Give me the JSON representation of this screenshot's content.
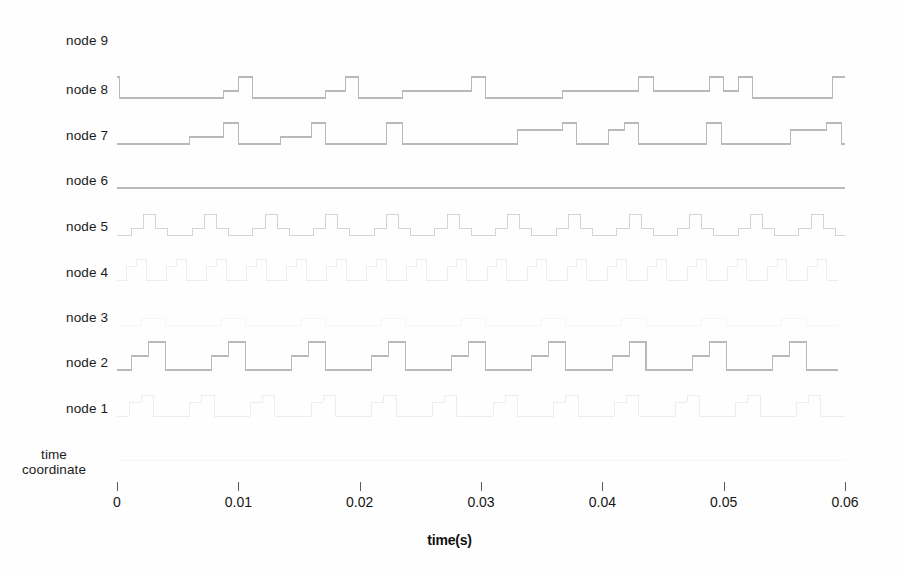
{
  "figure": {
    "background": "#fefefe",
    "trace_color_strong": "#b9b9bd",
    "trace_color_faint": "#ececf0",
    "axis_color": "#5a5a5a"
  },
  "axes": {
    "x_title": "time(s)",
    "x_ticks": [
      "0",
      "0.01",
      "0.02",
      "0.03",
      "0.04",
      "0.05",
      "0.06"
    ],
    "x_tick_values": [
      0,
      0.01,
      0.02,
      0.03,
      0.04,
      0.05,
      0.06
    ],
    "x_min": 0,
    "x_max": 0.06,
    "y_labels": [
      "node 9",
      "node 8",
      "node 7",
      "node 6",
      "node 5",
      "node 4",
      "node 3",
      "node 2",
      "node 1",
      "time\ncoordinate"
    ]
  },
  "chart_data": {
    "type": "line",
    "title": "",
    "xlabel": "time(s)",
    "ylabel": "",
    "xlim": [
      0,
      0.06
    ],
    "grid": false,
    "legend": null,
    "row_labels": [
      "node 9",
      "node 8",
      "node 7",
      "node 6",
      "node 5",
      "node 4",
      "node 3",
      "node 2",
      "node 1",
      "time coordinate"
    ],
    "series": [
      {
        "name": "node 9 / node 8 trace",
        "baseline_label": "node 8",
        "visibility": "strong",
        "points": [
          [
            0.0,
            3
          ],
          [
            0.0002,
            3
          ],
          [
            0.0002,
            0
          ],
          [
            0.0088,
            0
          ],
          [
            0.0088,
            1
          ],
          [
            0.01,
            1
          ],
          [
            0.01,
            3
          ],
          [
            0.0112,
            3
          ],
          [
            0.0112,
            0
          ],
          [
            0.0172,
            0
          ],
          [
            0.0172,
            1
          ],
          [
            0.0188,
            1
          ],
          [
            0.0188,
            3
          ],
          [
            0.0199,
            3
          ],
          [
            0.0199,
            0
          ],
          [
            0.0235,
            0
          ],
          [
            0.0235,
            1
          ],
          [
            0.0292,
            1
          ],
          [
            0.0292,
            3
          ],
          [
            0.0304,
            3
          ],
          [
            0.0304,
            0
          ],
          [
            0.0367,
            0
          ],
          [
            0.0367,
            1
          ],
          [
            0.043,
            1
          ],
          [
            0.043,
            3
          ],
          [
            0.0442,
            3
          ],
          [
            0.0442,
            1
          ],
          [
            0.0488,
            1
          ],
          [
            0.0488,
            3
          ],
          [
            0.05,
            3
          ],
          [
            0.05,
            1
          ],
          [
            0.0512,
            1
          ],
          [
            0.0512,
            3
          ],
          [
            0.0524,
            3
          ],
          [
            0.0524,
            0
          ],
          [
            0.059,
            0
          ],
          [
            0.059,
            3
          ],
          [
            0.06,
            3
          ]
        ]
      },
      {
        "name": "node 7 trace",
        "baseline_label": "node 7",
        "visibility": "strong",
        "points": [
          [
            0.0,
            0
          ],
          [
            0.006,
            0
          ],
          [
            0.006,
            1
          ],
          [
            0.0088,
            1
          ],
          [
            0.0088,
            3
          ],
          [
            0.01,
            3
          ],
          [
            0.01,
            0
          ],
          [
            0.0135,
            0
          ],
          [
            0.0135,
            1
          ],
          [
            0.016,
            1
          ],
          [
            0.016,
            3
          ],
          [
            0.0172,
            3
          ],
          [
            0.0172,
            0
          ],
          [
            0.0222,
            0
          ],
          [
            0.0222,
            3
          ],
          [
            0.0235,
            3
          ],
          [
            0.0235,
            0
          ],
          [
            0.033,
            0
          ],
          [
            0.033,
            2
          ],
          [
            0.0367,
            2
          ],
          [
            0.0367,
            3
          ],
          [
            0.0379,
            3
          ],
          [
            0.0379,
            0
          ],
          [
            0.0405,
            0
          ],
          [
            0.0405,
            2
          ],
          [
            0.0418,
            2
          ],
          [
            0.0418,
            3
          ],
          [
            0.043,
            3
          ],
          [
            0.043,
            0
          ],
          [
            0.0486,
            0
          ],
          [
            0.0486,
            3
          ],
          [
            0.0498,
            3
          ],
          [
            0.0498,
            0
          ],
          [
            0.0555,
            0
          ],
          [
            0.0555,
            2
          ],
          [
            0.0585,
            2
          ],
          [
            0.0585,
            3
          ],
          [
            0.0597,
            3
          ],
          [
            0.0597,
            0
          ],
          [
            0.06,
            0
          ]
        ]
      },
      {
        "name": "node 6 trace",
        "baseline_label": "node 6",
        "visibility": "strong",
        "constant": true,
        "points": [
          [
            0.0,
            0
          ],
          [
            0.06,
            0
          ]
        ]
      },
      {
        "name": "node 5 trace",
        "baseline_label": "node 5",
        "visibility": "medium",
        "periodic": true,
        "period": 0.005,
        "cycle_points": [
          [
            0.0,
            0
          ],
          [
            0.0012,
            0
          ],
          [
            0.0012,
            1
          ],
          [
            0.0022,
            1
          ],
          [
            0.0022,
            3
          ],
          [
            0.0032,
            3
          ],
          [
            0.0032,
            1
          ],
          [
            0.0042,
            1
          ],
          [
            0.0042,
            0
          ],
          [
            0.005,
            0
          ]
        ],
        "cycles": 12
      },
      {
        "name": "node 4 trace",
        "baseline_label": "node 4",
        "visibility": "faint",
        "periodic": true,
        "period": 0.0033,
        "cycle_points": [
          [
            0.0,
            0
          ],
          [
            0.0008,
            0
          ],
          [
            0.0008,
            2
          ],
          [
            0.0016,
            2
          ],
          [
            0.0016,
            3
          ],
          [
            0.0024,
            3
          ],
          [
            0.0024,
            0
          ],
          [
            0.0033,
            0
          ]
        ],
        "cycles": 18
      },
      {
        "name": "node 3 trace",
        "baseline_label": "node 3",
        "visibility": "very-faint",
        "periodic": true,
        "period": 0.0066,
        "cycle_points": [
          [
            0.0,
            0
          ],
          [
            0.002,
            0
          ],
          [
            0.002,
            1
          ],
          [
            0.004,
            1
          ],
          [
            0.004,
            0
          ],
          [
            0.0066,
            0
          ]
        ],
        "cycles": 9
      },
      {
        "name": "node 2 trace",
        "baseline_label": "node 2",
        "visibility": "strong",
        "periodic": true,
        "period": 0.0066,
        "cycle_points": [
          [
            0.0,
            0
          ],
          [
            0.0012,
            0
          ],
          [
            0.0012,
            2
          ],
          [
            0.0026,
            2
          ],
          [
            0.0026,
            4
          ],
          [
            0.004,
            4
          ],
          [
            0.004,
            0
          ],
          [
            0.0066,
            0
          ]
        ],
        "cycles": 9
      },
      {
        "name": "node 1 trace",
        "baseline_label": "node 1",
        "visibility": "faint",
        "periodic": true,
        "period": 0.005,
        "cycle_points": [
          [
            0.0,
            0
          ],
          [
            0.001,
            0
          ],
          [
            0.001,
            2
          ],
          [
            0.002,
            2
          ],
          [
            0.002,
            3
          ],
          [
            0.003,
            3
          ],
          [
            0.003,
            0
          ],
          [
            0.005,
            0
          ]
        ],
        "cycles": 12
      },
      {
        "name": "time coordinate trace",
        "baseline_label": "time coordinate",
        "visibility": "very-faint",
        "constant": true,
        "points": [
          [
            0.0,
            0
          ],
          [
            0.06,
            0
          ]
        ]
      }
    ]
  }
}
